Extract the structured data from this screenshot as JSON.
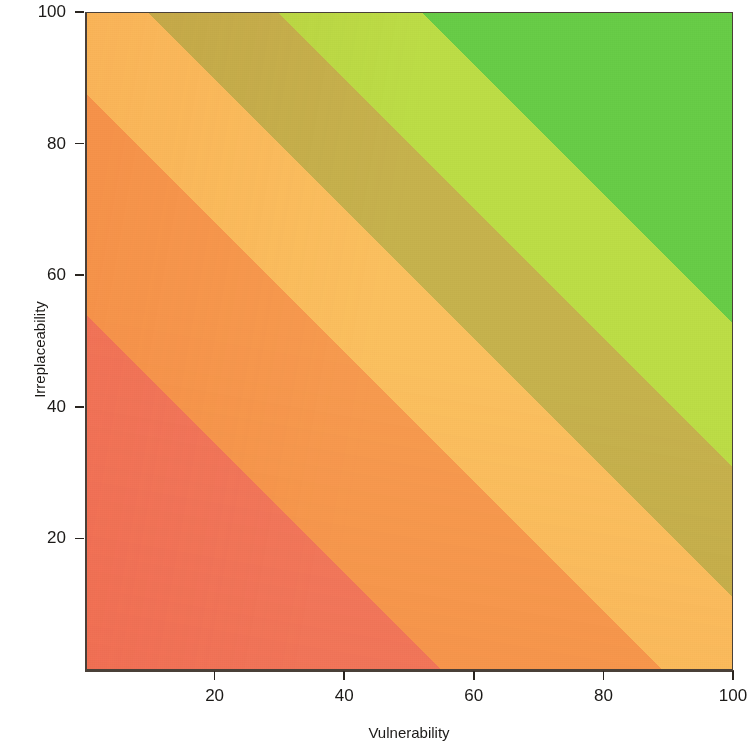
{
  "chart_data": {
    "type": "heatmap",
    "title": "",
    "subtitle": "",
    "xlabel": "Vulnerability",
    "ylabel": "Irreplaceability",
    "xlim": [
      0,
      100
    ],
    "ylim": [
      0,
      100
    ],
    "xticks": [
      20,
      40,
      60,
      80,
      100
    ],
    "yticks": [
      20,
      40,
      60,
      80,
      100
    ],
    "grid": false,
    "legend": "none",
    "annotations": [],
    "value_function": "priority = (vulnerability + irreplaceability) / 2",
    "color_bands": [
      {
        "name": "very-low-priority-salmon",
        "value_range": [
          0,
          25
        ],
        "color": "#F2795C"
      },
      {
        "name": "low-priority-orange",
        "value_range": [
          25,
          42
        ],
        "color": "#F79B4E"
      },
      {
        "name": "moderate-priority-light-orange",
        "value_range": [
          42,
          53
        ],
        "color": "#FBC05E"
      },
      {
        "name": "transition-olive",
        "value_range": [
          53,
          63
        ],
        "color": "#C6B24C"
      },
      {
        "name": "high-priority-yellow-green",
        "value_range": [
          63,
          74
        ],
        "color": "#BCDD45"
      },
      {
        "name": "very-high-priority-green",
        "value_range": [
          74,
          100
        ],
        "color": "#67CC46"
      }
    ],
    "corner_values": {
      "bottom_left": {
        "x": 0,
        "y": 0,
        "priority": 0,
        "color": "#F2795C"
      },
      "bottom_right": {
        "x": 100,
        "y": 0,
        "priority": 50,
        "color": "#FBC05E"
      },
      "top_left": {
        "x": 0,
        "y": 100,
        "priority": 50,
        "color": "#FBC05E"
      },
      "top_right": {
        "x": 100,
        "y": 100,
        "priority": 100,
        "color": "#67CC46"
      }
    },
    "band_edges_on_top_edge_x": [
      8,
      16,
      22,
      30,
      40,
      52
    ],
    "band_edges_on_right_edge_y": [
      8,
      16,
      22,
      30,
      40,
      52
    ],
    "axis_color": "#4a4038",
    "text_color": "#1c1a18",
    "background_color": "#ffffff"
  },
  "axes": {
    "x": {
      "title": "Vulnerability",
      "ticks": [
        {
          "label": "20",
          "value": 20
        },
        {
          "label": "40",
          "value": 40
        },
        {
          "label": "60",
          "value": 60
        },
        {
          "label": "80",
          "value": 80
        },
        {
          "label": "100",
          "value": 100
        }
      ]
    },
    "y": {
      "title": "Irreplaceability",
      "ticks": [
        {
          "label": "20",
          "value": 20
        },
        {
          "label": "40",
          "value": 40
        },
        {
          "label": "60",
          "value": 60
        },
        {
          "label": "80",
          "value": 80
        },
        {
          "label": "100",
          "value": 100
        }
      ]
    }
  }
}
